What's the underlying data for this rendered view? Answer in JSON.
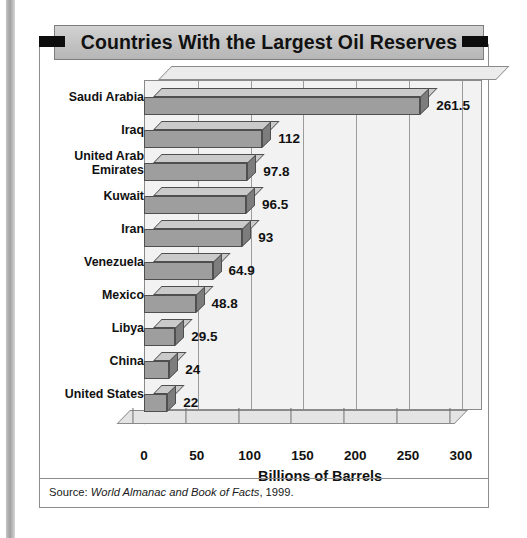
{
  "title": "Countries With the Largest Oil Reserves",
  "source": {
    "prefix": "Source: ",
    "publication": "World Almanac and Book of Facts",
    "suffix": ", 1999."
  },
  "colors": {
    "banner_bg": "#c2c2c2",
    "banner_tab": "#0d0d0d",
    "bar_face": "#9e9e9e",
    "bar_top": "#cacaca",
    "bar_side": "#7d7d7d",
    "plot_bg": "#f2f2f2",
    "gridline": "#9b9b9b",
    "frame": "#8d8d8d"
  },
  "chart_data": {
    "type": "bar",
    "orientation": "horizontal",
    "title": "Countries With the Largest Oil Reserves",
    "xlabel": "Billions of Barrels",
    "ylabel": "",
    "xlim": [
      0,
      320
    ],
    "xticks": [
      0,
      50,
      100,
      150,
      200,
      250,
      300
    ],
    "xtick_labels": [
      "0",
      "50",
      "100",
      "150",
      "200",
      "250",
      "300"
    ],
    "grid": true,
    "legend": false,
    "style": "3d",
    "categories": [
      "Saudi Arabia",
      "Iraq",
      "United Arab Emirates",
      "Kuwait",
      "Iran",
      "Venezuela",
      "Mexico",
      "Libya",
      "China",
      "United States"
    ],
    "values": [
      261.5,
      112,
      97.8,
      96.5,
      93,
      64.9,
      48.8,
      29.5,
      24,
      22
    ],
    "value_labels": [
      "261.5",
      "112",
      "97.8",
      "96.5",
      "93",
      "64.9",
      "48.8",
      "29.5",
      "24",
      "22"
    ]
  }
}
